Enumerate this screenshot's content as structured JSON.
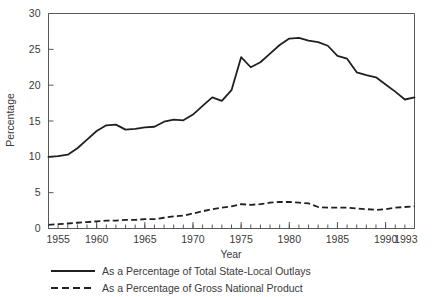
{
  "chart_data": {
    "type": "line",
    "title": "",
    "xlabel": "Year",
    "ylabel": "Percentage",
    "xlim": [
      1955,
      1993
    ],
    "ylim": [
      0,
      30
    ],
    "yticks": [
      0,
      5,
      10,
      15,
      20,
      25,
      30
    ],
    "ytick_labels": [
      "0",
      "5",
      "10",
      "15",
      "20",
      "25",
      "30"
    ],
    "xticks": [
      1955,
      1960,
      1965,
      1970,
      1975,
      1980,
      1985,
      1990,
      1993
    ],
    "xtick_labels": [
      "1955",
      "1960",
      "1965",
      "1970",
      "1975",
      "1980",
      "1985",
      "1990",
      "1993"
    ],
    "x_minor_tick_interval": 1,
    "grid": false,
    "legend_position": "below",
    "x": [
      1955,
      1956,
      1957,
      1958,
      1959,
      1960,
      1961,
      1962,
      1963,
      1964,
      1965,
      1966,
      1967,
      1968,
      1969,
      1970,
      1971,
      1972,
      1973,
      1974,
      1975,
      1976,
      1977,
      1978,
      1979,
      1980,
      1981,
      1982,
      1983,
      1984,
      1985,
      1986,
      1987,
      1988,
      1989,
      1990,
      1991,
      1992,
      1993
    ],
    "series": [
      {
        "name": "As a Percentage of Total State-Local Outlays",
        "style": "solid",
        "color": "#231f20",
        "values": [
          10.0,
          10.1,
          10.3,
          11.2,
          12.4,
          13.6,
          14.4,
          14.5,
          13.8,
          13.9,
          14.1,
          14.2,
          14.9,
          15.2,
          15.1,
          15.9,
          17.1,
          18.3,
          17.8,
          19.3,
          23.9,
          22.5,
          23.2,
          24.4,
          25.6,
          26.5,
          26.6,
          26.2,
          26.0,
          25.5,
          24.1,
          23.7,
          21.8,
          21.4,
          21.1,
          20.1,
          19.1,
          18.0,
          18.3
        ]
      },
      {
        "name": "As a Percentage of Gross National Product",
        "style": "dashed",
        "color": "#231f20",
        "values": [
          0.5,
          0.6,
          0.7,
          0.8,
          0.9,
          1.0,
          1.1,
          1.1,
          1.2,
          1.2,
          1.3,
          1.3,
          1.5,
          1.7,
          1.8,
          2.1,
          2.4,
          2.7,
          2.9,
          3.1,
          3.4,
          3.3,
          3.4,
          3.6,
          3.7,
          3.7,
          3.6,
          3.5,
          3.0,
          2.9,
          2.9,
          2.9,
          2.8,
          2.7,
          2.6,
          2.7,
          2.9,
          3.0,
          3.1
        ]
      }
    ]
  },
  "legend": {
    "items": [
      {
        "label": "As a Percentage of Total State-Local Outlays",
        "style": "solid"
      },
      {
        "label": "As a Percentage of Gross National Product",
        "style": "dashed"
      }
    ]
  },
  "axes": {
    "x_title": "Year",
    "y_title": "Percentage"
  }
}
